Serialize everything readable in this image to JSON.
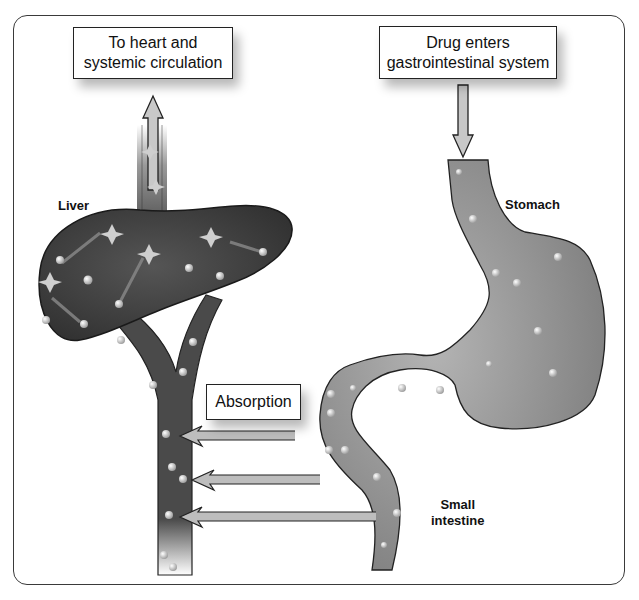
{
  "diagram": {
    "callouts": {
      "heart": {
        "line1": "To heart and",
        "line2": "systemic circulation"
      },
      "drug_entry": {
        "line1": "Drug enters",
        "line2": "gastrointestinal system"
      },
      "absorption": {
        "label": "Absorption"
      }
    },
    "organ_labels": {
      "liver": "Liver",
      "stomach": "Stomach",
      "small_intestine_line1": "Small",
      "small_intestine_line2": "intestine"
    },
    "colors": {
      "liver_fill": "#3f3f3f",
      "vessel_fill": "#4a4a4a",
      "stomach_fill": "#8c8c8c",
      "arrow_fill": "#bdbdbd",
      "outline": "#222222",
      "particle": "#d9d9d9"
    },
    "flow": [
      "Drug enters gastrointestinal system",
      "Stomach",
      "Small intestine",
      "Absorption",
      "Liver",
      "To heart and systemic circulation"
    ]
  }
}
